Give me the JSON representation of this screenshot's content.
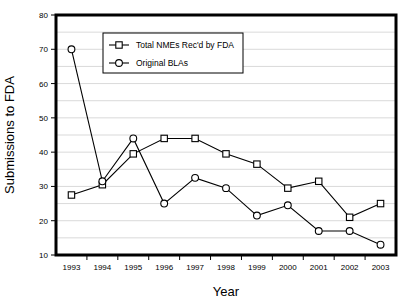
{
  "chart_data": {
    "type": "line",
    "title": "",
    "xlabel": "Year",
    "ylabel": "Submissions to FDA",
    "categories": [
      "1993",
      "1994",
      "1995",
      "1996",
      "1997",
      "1998",
      "1999",
      "2000",
      "2001",
      "2002",
      "2003"
    ],
    "ylim": [
      10,
      80
    ],
    "ytick_labels": [
      "10",
      "20",
      "30",
      "40",
      "50",
      "60",
      "70",
      "80"
    ],
    "yticks": [
      10,
      20,
      30,
      40,
      50,
      60,
      70,
      80
    ],
    "gridlines": [
      15,
      20,
      25,
      30,
      35,
      40,
      45,
      50,
      55,
      60,
      65,
      70,
      75
    ],
    "grid": true,
    "legend_position": "top-left-inside",
    "series": [
      {
        "name": "Total NMEs Rec'd by FDA",
        "marker": "square",
        "values": [
          27.5,
          30.5,
          39.5,
          44,
          44,
          39.5,
          36.5,
          29.5,
          31.5,
          21,
          25
        ]
      },
      {
        "name": "Original BLAs",
        "marker": "circle",
        "values": [
          70,
          31.5,
          44,
          25,
          32.5,
          29.5,
          21.5,
          24.5,
          17,
          17,
          13
        ]
      }
    ]
  }
}
